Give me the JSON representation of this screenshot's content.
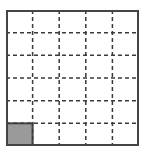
{
  "grid": {
    "rows": 6,
    "cols": 5,
    "border_color": "#444444",
    "line_color": "#3a3a3a",
    "fill_color": "#9a9a9a",
    "filled_cells": [
      {
        "row": 5,
        "col": 0
      }
    ]
  }
}
